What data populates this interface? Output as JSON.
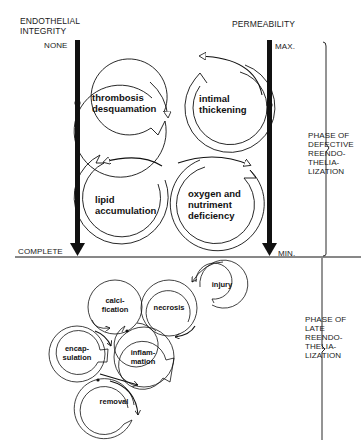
{
  "axes": {
    "left": {
      "title": "ENDOTHELIAL\nINTEGRITY",
      "top_label": "NONE",
      "bottom_label": "COMPLETE"
    },
    "right": {
      "title": "PERMEABILITY",
      "top_label": "MAX.",
      "bottom_label": "MIN."
    }
  },
  "phases": [
    {
      "label": "PHASE OF\nDEFECTIVE\nREENDO-\nTHELIA-\nLIZATION"
    },
    {
      "label": "PHASE OF\nLATE\nREENDO-\nTHELIA-\nLIZATION"
    }
  ],
  "upper_cycle": [
    {
      "label": "thrombosis\ndesquamation"
    },
    {
      "label": "intimal\nthickening"
    },
    {
      "label": "lipid\naccumulation"
    },
    {
      "label": "oxygen and\nnutriment\ndeficiency"
    }
  ],
  "lower_cycle": [
    {
      "label": "injury"
    },
    {
      "label": "calci-\nfication"
    },
    {
      "label": "necrosis"
    },
    {
      "label": "encap-\nsulation"
    },
    {
      "label": "inflam-\nmation"
    },
    {
      "label": "removal"
    }
  ],
  "colors": {
    "ink": "#111111",
    "background": "#ffffff"
  }
}
